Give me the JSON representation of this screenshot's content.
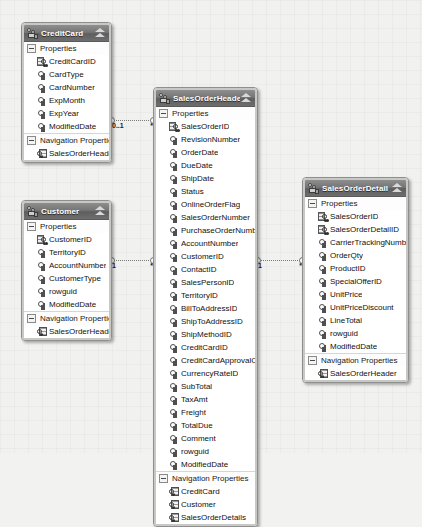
{
  "app": {
    "title": "Entity Data Model Designer",
    "section_properties_label": "Properties",
    "section_navigation_label": "Navigation Properties"
  },
  "entities": [
    {
      "id": "creditcard",
      "name": "CreditCard",
      "x": 21,
      "y": 22,
      "width": 91,
      "properties": [
        {
          "name": "CreditCardID",
          "kind": "primary-key"
        },
        {
          "name": "CardType",
          "kind": "scalar"
        },
        {
          "name": "CardNumber",
          "kind": "scalar"
        },
        {
          "name": "ExpMonth",
          "kind": "scalar"
        },
        {
          "name": "ExpYear",
          "kind": "scalar"
        },
        {
          "name": "ModifiedDate",
          "kind": "scalar"
        }
      ],
      "navigation_properties": [
        {
          "name": "SalesOrderHeaders"
        }
      ]
    },
    {
      "id": "salesorderheader",
      "name": "SalesOrderHeader",
      "x": 153,
      "y": 87,
      "width": 105,
      "properties": [
        {
          "name": "SalesOrderID",
          "kind": "primary-key"
        },
        {
          "name": "RevisionNumber",
          "kind": "scalar"
        },
        {
          "name": "OrderDate",
          "kind": "scalar"
        },
        {
          "name": "DueDate",
          "kind": "scalar"
        },
        {
          "name": "ShipDate",
          "kind": "scalar"
        },
        {
          "name": "Status",
          "kind": "scalar"
        },
        {
          "name": "OnlineOrderFlag",
          "kind": "scalar"
        },
        {
          "name": "SalesOrderNumber",
          "kind": "scalar"
        },
        {
          "name": "PurchaseOrderNumber",
          "kind": "scalar"
        },
        {
          "name": "AccountNumber",
          "kind": "scalar"
        },
        {
          "name": "CustomerID",
          "kind": "scalar"
        },
        {
          "name": "ContactID",
          "kind": "scalar"
        },
        {
          "name": "SalesPersonID",
          "kind": "scalar"
        },
        {
          "name": "TerritoryID",
          "kind": "scalar"
        },
        {
          "name": "BillToAddressID",
          "kind": "scalar"
        },
        {
          "name": "ShipToAddressID",
          "kind": "scalar"
        },
        {
          "name": "ShipMethodID",
          "kind": "scalar"
        },
        {
          "name": "CreditCardID",
          "kind": "scalar"
        },
        {
          "name": "CreditCardApprovalCode",
          "kind": "scalar"
        },
        {
          "name": "CurrencyRateID",
          "kind": "scalar"
        },
        {
          "name": "SubTotal",
          "kind": "scalar"
        },
        {
          "name": "TaxAmt",
          "kind": "scalar"
        },
        {
          "name": "Freight",
          "kind": "scalar"
        },
        {
          "name": "TotalDue",
          "kind": "scalar"
        },
        {
          "name": "Comment",
          "kind": "scalar"
        },
        {
          "name": "rowguid",
          "kind": "scalar"
        },
        {
          "name": "ModifiedDate",
          "kind": "scalar"
        }
      ],
      "navigation_properties": [
        {
          "name": "CreditCard"
        },
        {
          "name": "Customer"
        },
        {
          "name": "SalesOrderDetails"
        }
      ]
    },
    {
      "id": "customer",
      "name": "Customer",
      "x": 21,
      "y": 200,
      "width": 91,
      "properties": [
        {
          "name": "CustomerID",
          "kind": "primary-key"
        },
        {
          "name": "TerritoryID",
          "kind": "scalar"
        },
        {
          "name": "AccountNumber",
          "kind": "scalar"
        },
        {
          "name": "CustomerType",
          "kind": "scalar"
        },
        {
          "name": "rowguid",
          "kind": "scalar"
        },
        {
          "name": "ModifiedDate",
          "kind": "scalar"
        }
      ],
      "navigation_properties": [
        {
          "name": "SalesOrderHeaders"
        }
      ]
    },
    {
      "id": "salesorderdetail",
      "name": "SalesOrderDetail",
      "x": 302,
      "y": 177,
      "width": 107,
      "properties": [
        {
          "name": "SalesOrderID",
          "kind": "primary-key"
        },
        {
          "name": "SalesOrderDetailID",
          "kind": "primary-key"
        },
        {
          "name": "CarrierTrackingNumber",
          "kind": "scalar"
        },
        {
          "name": "OrderQty",
          "kind": "scalar"
        },
        {
          "name": "ProductID",
          "kind": "scalar"
        },
        {
          "name": "SpecialOfferID",
          "kind": "scalar"
        },
        {
          "name": "UnitPrice",
          "kind": "scalar"
        },
        {
          "name": "UnitPriceDiscount",
          "kind": "scalar"
        },
        {
          "name": "LineTotal",
          "kind": "scalar"
        },
        {
          "name": "rowguid",
          "kind": "scalar"
        },
        {
          "name": "ModifiedDate",
          "kind": "scalar"
        }
      ],
      "navigation_properties": [
        {
          "name": "SalesOrderHeader"
        }
      ]
    }
  ],
  "associations": [
    {
      "id": "creditcard-salesorderheader",
      "from": "CreditCard",
      "to": "SalesOrderHeader",
      "from_multiplicity": "0..1",
      "to_multiplicity": "*",
      "x": 110,
      "y": 112,
      "width": 45
    },
    {
      "id": "customer-salesorderheader",
      "from": "Customer",
      "to": "SalesOrderHeader",
      "from_multiplicity": "1",
      "to_multiplicity": "*",
      "x": 110,
      "y": 252,
      "width": 45
    },
    {
      "id": "salesorderheader-salesorderdetail",
      "from": "SalesOrderHeader",
      "to": "SalesOrderDetail",
      "from_multiplicity": "1",
      "to_multiplicity": "*",
      "x": 256,
      "y": 252,
      "width": 48
    }
  ]
}
